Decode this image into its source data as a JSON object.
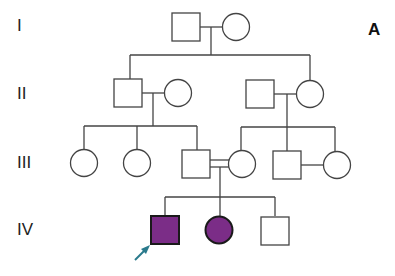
{
  "panel_label": "A",
  "generations": [
    {
      "label": "I",
      "y": 27
    },
    {
      "label": "II",
      "y": 94
    },
    {
      "label": "III",
      "y": 164
    },
    {
      "label": "IV",
      "y": 230
    }
  ],
  "legend": {
    "affected_color": "#7b2d87",
    "proband_arrow_color": "#2a7a8c",
    "line_color": "#444444"
  },
  "individuals": [
    {
      "id": "I-1",
      "sex": "male",
      "affected": false
    },
    {
      "id": "I-2",
      "sex": "female",
      "affected": false
    },
    {
      "id": "II-1",
      "sex": "male",
      "affected": false
    },
    {
      "id": "II-2",
      "sex": "female",
      "affected": false
    },
    {
      "id": "II-3",
      "sex": "male",
      "affected": false
    },
    {
      "id": "II-4",
      "sex": "female",
      "affected": false
    },
    {
      "id": "III-1",
      "sex": "female",
      "affected": false
    },
    {
      "id": "III-2",
      "sex": "female",
      "affected": false
    },
    {
      "id": "III-3",
      "sex": "male",
      "affected": false
    },
    {
      "id": "III-4",
      "sex": "female",
      "affected": false
    },
    {
      "id": "III-5",
      "sex": "male",
      "affected": false
    },
    {
      "id": "III-6",
      "sex": "female",
      "affected": false
    },
    {
      "id": "IV-1",
      "sex": "male",
      "affected": true,
      "proband": true
    },
    {
      "id": "IV-2",
      "sex": "female",
      "affected": true
    },
    {
      "id": "IV-3",
      "sex": "male",
      "affected": false
    }
  ],
  "consanguineous_union": "III-3 x III-4"
}
